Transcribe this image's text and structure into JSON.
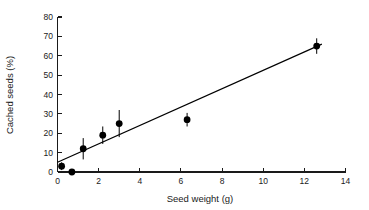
{
  "chart_data": {
    "type": "scatter",
    "title": "",
    "xlabel": "Seed weight (g)",
    "ylabel": "Cached seeds (%)",
    "xlim": [
      0,
      14
    ],
    "ylim": [
      0,
      80
    ],
    "xticks": [
      0,
      2,
      4,
      6,
      8,
      10,
      12,
      14
    ],
    "yticks": [
      0,
      10,
      20,
      30,
      40,
      50,
      60,
      70,
      80
    ],
    "grid": false,
    "legend": "none",
    "marker": "filled-circle",
    "marker_color": "#000000",
    "line_color": "#000000",
    "x": [
      0.2,
      0.7,
      1.25,
      2.2,
      3.0,
      6.3,
      12.6
    ],
    "y": [
      3.0,
      0.0,
      12.0,
      19.0,
      25.0,
      27.0,
      65.0
    ],
    "yerr": [
      2.0,
      0.0,
      5.5,
      4.5,
      7.0,
      3.5,
      4.0
    ],
    "points": [
      {
        "x": 0.2,
        "y": 3.0,
        "yerr": 2.0
      },
      {
        "x": 0.7,
        "y": 0.0,
        "yerr": 0.0
      },
      {
        "x": 1.25,
        "y": 12.0,
        "yerr": 5.5
      },
      {
        "x": 2.2,
        "y": 19.0,
        "yerr": 4.5
      },
      {
        "x": 3.0,
        "y": 25.0,
        "yerr": 7.0
      },
      {
        "x": 6.3,
        "y": 27.0,
        "yerr": 3.5
      },
      {
        "x": 12.6,
        "y": 65.0,
        "yerr": 4.0
      }
    ],
    "fit_line": {
      "type": "linear-regression",
      "x_start": 0.0,
      "y_start": 5.0,
      "x_end": 12.85,
      "y_end": 66.0
    }
  },
  "axes": {
    "x_title": "Seed weight (g)",
    "y_title": "Cached seeds (%)",
    "x_tick_labels": [
      "0",
      "2",
      "4",
      "6",
      "8",
      "10",
      "12",
      "14"
    ],
    "y_tick_labels": [
      "0",
      "10",
      "20",
      "30",
      "40",
      "50",
      "60",
      "70",
      "80"
    ]
  }
}
